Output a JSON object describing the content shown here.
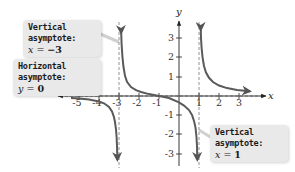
{
  "figure": {
    "function": "f(x) = (x + 1) / ((x + 3)(x - 1))",
    "axes": {
      "x_label": "x",
      "y_label": "y",
      "x_ticks": [
        "-5",
        "-4",
        "-3",
        "-2",
        "-1",
        "1",
        "2",
        "3"
      ],
      "y_ticks": [
        "3",
        "2",
        "1",
        "-1",
        "-2",
        "-3"
      ]
    },
    "callouts": [
      {
        "title": "Vertical asymptote:",
        "equation_var": "x",
        "equation_op": " = ",
        "equation_val": "−3"
      },
      {
        "title": "Horizontal asymptote:",
        "equation_var": "y",
        "equation_op": " = ",
        "equation_val": "0"
      },
      {
        "title": "Vertical asymptote:",
        "equation_var": "x",
        "equation_op": " = ",
        "equation_val": "1"
      }
    ],
    "colors": {
      "curve": "#5a5a5a",
      "axis": "#333333",
      "asymptote": "#777777",
      "callout_bg": "#e9e9e9"
    }
  }
}
